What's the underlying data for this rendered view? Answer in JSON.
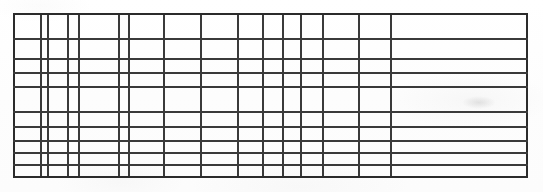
{
  "document": {
    "kind": "scanned-blank-table",
    "description": "Scanned blank ruled table grid with no visible text content",
    "page_width": 543,
    "page_height": 192,
    "background_color": "#fefefe",
    "ink_color": "#3a3a3a",
    "border_color": "#2b2b2b"
  },
  "table": {
    "frame": {
      "left": 13,
      "top": 13,
      "right": 526,
      "bottom": 176,
      "border_width": 2
    },
    "column_count": 16,
    "row_count": 10,
    "column_edges": [
      13,
      40,
      47,
      67,
      78,
      118,
      128,
      163,
      200,
      237,
      262,
      282,
      300,
      322,
      358,
      390,
      526
    ],
    "row_edges": [
      13,
      38,
      58,
      72,
      86,
      111,
      126,
      140,
      152,
      164,
      176
    ],
    "column_headers": [
      "",
      "",
      "",
      "",
      "",
      "",
      "",
      "",
      "",
      "",
      "",
      "",
      "",
      "",
      "",
      ""
    ],
    "rows": [
      {
        "cells": [
          "",
          "",
          "",
          "",
          "",
          "",
          "",
          "",
          "",
          "",
          "",
          "",
          "",
          "",
          "",
          ""
        ]
      },
      {
        "cells": [
          "",
          "",
          "",
          "",
          "",
          "",
          "",
          "",
          "",
          "",
          "",
          "",
          "",
          "",
          "",
          ""
        ]
      },
      {
        "cells": [
          "",
          "",
          "",
          "",
          "",
          "",
          "",
          "",
          "",
          "",
          "",
          "",
          "",
          "",
          "",
          ""
        ]
      },
      {
        "cells": [
          "",
          "",
          "",
          "",
          "",
          "",
          "",
          "",
          "",
          "",
          "",
          "",
          "",
          "",
          "",
          ""
        ]
      },
      {
        "cells": [
          "",
          "",
          "",
          "",
          "",
          "",
          "",
          "",
          "",
          "",
          "",
          "",
          "",
          "",
          "",
          ""
        ]
      },
      {
        "cells": [
          "",
          "",
          "",
          "",
          "",
          "",
          "",
          "",
          "",
          "",
          "",
          "",
          "",
          "",
          "",
          ""
        ]
      },
      {
        "cells": [
          "",
          "",
          "",
          "",
          "",
          "",
          "",
          "",
          "",
          "",
          "",
          "",
          "",
          "",
          "",
          ""
        ]
      },
      {
        "cells": [
          "",
          "",
          "",
          "",
          "",
          "",
          "",
          "",
          "",
          "",
          "",
          "",
          "",
          "",
          "",
          ""
        ]
      },
      {
        "cells": [
          "",
          "",
          "",
          "",
          "",
          "",
          "",
          "",
          "",
          "",
          "",
          "",
          "",
          "",
          "",
          ""
        ]
      },
      {
        "cells": [
          "",
          "",
          "",
          "",
          "",
          "",
          "",
          "",
          "",
          "",
          "",
          "",
          "",
          "",
          "",
          ""
        ]
      }
    ]
  },
  "artifacts": [
    {
      "name": "scan-smudge-right",
      "x": 462,
      "y": 96,
      "width": 34,
      "height": 13
    }
  ]
}
